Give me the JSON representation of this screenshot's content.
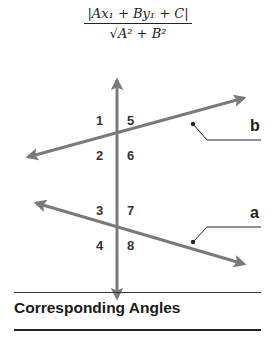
{
  "formula": {
    "numerator": "|Ax₁ + By₁ + C|",
    "denominator": "√A² + B²",
    "description": "distance from point to line"
  },
  "diagram": {
    "line_color": "#7a7a7a",
    "angle_labels": {
      "a1": "1",
      "a2": "2",
      "a3": "3",
      "a4": "4",
      "a5": "5",
      "a6": "6",
      "a7": "7",
      "a8": "8"
    },
    "line_b_label": "b",
    "line_a_label": "a"
  },
  "caption": {
    "title": "Corresponding Angles"
  }
}
